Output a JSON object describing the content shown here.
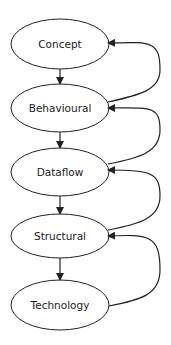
{
  "diagram": {
    "type": "flow",
    "colors": {
      "stroke": "#222222",
      "fill": "#ffffff",
      "text": "#222222"
    },
    "nodes": [
      {
        "id": "concept",
        "label": "Concept",
        "cx": 60,
        "cy": 44
      },
      {
        "id": "behavioural",
        "label": "Behavioural",
        "cx": 60,
        "cy": 108
      },
      {
        "id": "dataflow",
        "label": "Dataflow",
        "cx": 60,
        "cy": 172
      },
      {
        "id": "structural",
        "label": "Structural",
        "cx": 60,
        "cy": 236
      },
      {
        "id": "technology",
        "label": "Technology",
        "cx": 60,
        "cy": 305
      }
    ],
    "edges": [
      {
        "from": "concept",
        "to": "behavioural",
        "kind": "down"
      },
      {
        "from": "behavioural",
        "to": "dataflow",
        "kind": "down"
      },
      {
        "from": "dataflow",
        "to": "structural",
        "kind": "down"
      },
      {
        "from": "structural",
        "to": "technology",
        "kind": "down"
      },
      {
        "from": "behavioural",
        "to": "concept",
        "kind": "feedback"
      },
      {
        "from": "dataflow",
        "to": "behavioural",
        "kind": "feedback"
      },
      {
        "from": "structural",
        "to": "dataflow",
        "kind": "feedback"
      },
      {
        "from": "technology",
        "to": "structural",
        "kind": "feedback"
      }
    ]
  }
}
